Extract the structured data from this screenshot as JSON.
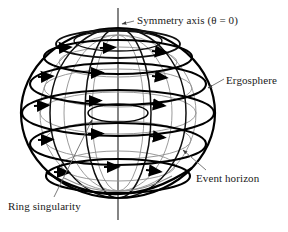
{
  "figure": {
    "background_color": "#ffffff",
    "stroke_color": "#000000",
    "inner_surface_color": "#8a8a8a",
    "leader_color": "#6b6b6b",
    "width": 288,
    "height": 232
  },
  "labels": {
    "symmetry_axis": "Symmetry axis (θ = 0)",
    "ergosphere": "Ergosphere",
    "event_horizon": "Event horizon",
    "ring_singularity": "Ring singularity"
  },
  "diagram_data": {
    "type": "schematic",
    "subject": "Kerr black hole",
    "components": [
      {
        "name": "ergosphere",
        "shape": "oblate-spheroid-outline",
        "center": [
          118,
          113
        ],
        "rx": 97,
        "ry": 85,
        "line_weight": "thick"
      },
      {
        "name": "event-horizon",
        "shape": "sphere-outline-inner",
        "center": [
          118,
          113
        ],
        "rx": 78,
        "ry": 78,
        "line_weight": "medium"
      },
      {
        "name": "ring-singularity",
        "shape": "ellipse",
        "center": [
          118,
          113
        ],
        "rx": 30,
        "ry": 9,
        "line_weight": "medium"
      },
      {
        "name": "symmetry-axis",
        "shape": "vertical-line",
        "x": 118,
        "y_top": 8,
        "y_bottom": 220,
        "theta": 0
      }
    ],
    "rotation_rings": {
      "count": 5,
      "direction": "counterclockwise-viewed-from-north",
      "arrow_style": "solid-triangle",
      "latitudes_y": [
        57,
        84,
        113,
        144,
        176
      ]
    },
    "meridian_count": 6
  }
}
